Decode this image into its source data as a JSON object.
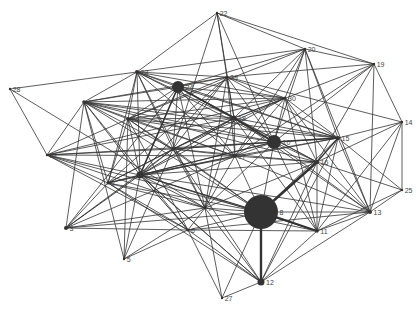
{
  "graph": {
    "type": "network",
    "width": 420,
    "height": 309,
    "colors": {
      "edge": "#333333",
      "node": "#333333",
      "label": "#444444",
      "background": "#ffffff"
    },
    "nodes": [
      {
        "id": "1",
        "x": 140,
        "y": 175,
        "r": 3.5
      },
      {
        "id": "2",
        "x": 108,
        "y": 183,
        "r": 1.5
      },
      {
        "id": "3",
        "x": 66,
        "y": 228,
        "r": 2.0
      },
      {
        "id": "4",
        "x": 84,
        "y": 102,
        "r": 1.8
      },
      {
        "id": "5",
        "x": 124,
        "y": 259,
        "r": 1.2
      },
      {
        "id": "6",
        "x": 188,
        "y": 230,
        "r": 1.5
      },
      {
        "id": "7",
        "x": 205,
        "y": 208,
        "r": 1.5
      },
      {
        "id": "8",
        "x": 261,
        "y": 212,
        "r": 17
      },
      {
        "id": "9",
        "x": 173,
        "y": 149,
        "r": 1.5
      },
      {
        "id": "10",
        "x": 274,
        "y": 142,
        "r": 7
      },
      {
        "id": "11",
        "x": 317,
        "y": 231,
        "r": 1.8
      },
      {
        "id": "12",
        "x": 261,
        "y": 282,
        "r": 3.5
      },
      {
        "id": "13",
        "x": 370,
        "y": 212,
        "r": 2.0
      },
      {
        "id": "14",
        "x": 402,
        "y": 122,
        "r": 1.2
      },
      {
        "id": "15",
        "x": 338,
        "y": 138,
        "r": 2.0
      },
      {
        "id": "16",
        "x": 317,
        "y": 162,
        "r": 2.0
      },
      {
        "id": "17",
        "x": 235,
        "y": 156,
        "r": 1.5
      },
      {
        "id": "18",
        "x": 234,
        "y": 118,
        "r": 2.5
      },
      {
        "id": "19",
        "x": 374,
        "y": 64,
        "r": 1.2
      },
      {
        "id": "20",
        "x": 305,
        "y": 49,
        "r": 1.2
      },
      {
        "id": "21",
        "x": 47,
        "y": 155,
        "r": 1.2
      },
      {
        "id": "22",
        "x": 217,
        "y": 13,
        "r": 1.2
      },
      {
        "id": "23",
        "x": 137,
        "y": 72,
        "r": 2.0
      },
      {
        "id": "24",
        "x": 178,
        "y": 87,
        "r": 6
      },
      {
        "id": "25",
        "x": 402,
        "y": 190,
        "r": 1.2
      },
      {
        "id": "26",
        "x": 128,
        "y": 119,
        "r": 1.8
      },
      {
        "id": "27",
        "x": 222,
        "y": 298,
        "r": 1.2
      },
      {
        "id": "28",
        "x": 10,
        "y": 89,
        "r": 1.2
      },
      {
        "id": "29",
        "x": 227,
        "y": 77,
        "r": 1.5
      },
      {
        "id": "30",
        "x": 285,
        "y": 98,
        "r": 1.5
      }
    ],
    "edges": [
      [
        "8",
        "12",
        3
      ],
      [
        "8",
        "16",
        3
      ],
      [
        "8",
        "11",
        2.5
      ],
      [
        "8",
        "1",
        1.5
      ],
      [
        "8",
        "9",
        1
      ],
      [
        "8",
        "2",
        1
      ],
      [
        "8",
        "13",
        1
      ],
      [
        "8",
        "3",
        1
      ],
      [
        "8",
        "6",
        1
      ],
      [
        "8",
        "7",
        1
      ],
      [
        "8",
        "10",
        1
      ],
      [
        "8",
        "15",
        1
      ],
      [
        "8",
        "4",
        1
      ],
      [
        "8",
        "26",
        1
      ],
      [
        "8",
        "21",
        1
      ],
      [
        "8",
        "27",
        1
      ],
      [
        "8",
        "17",
        1
      ],
      [
        "24",
        "18",
        2.5
      ],
      [
        "18",
        "10",
        2.5
      ],
      [
        "10",
        "15",
        2
      ],
      [
        "24",
        "1",
        2
      ],
      [
        "24",
        "23",
        1
      ],
      [
        "24",
        "29",
        1
      ],
      [
        "24",
        "20",
        1
      ],
      [
        "24",
        "30",
        1
      ],
      [
        "24",
        "3",
        1
      ],
      [
        "24",
        "9",
        1
      ],
      [
        "24",
        "4",
        1
      ],
      [
        "24",
        "26",
        1
      ],
      [
        "24",
        "16",
        1
      ],
      [
        "24",
        "15",
        1
      ],
      [
        "24",
        "17",
        1
      ],
      [
        "24",
        "7",
        1
      ],
      [
        "1",
        "2",
        1
      ],
      [
        "1",
        "3",
        1.2
      ],
      [
        "1",
        "4",
        1
      ],
      [
        "1",
        "5",
        1
      ],
      [
        "1",
        "6",
        1.2
      ],
      [
        "1",
        "7",
        1
      ],
      [
        "1",
        "9",
        1
      ],
      [
        "1",
        "10",
        1.2
      ],
      [
        "1",
        "15",
        1
      ],
      [
        "1",
        "16",
        1
      ],
      [
        "1",
        "17",
        1
      ],
      [
        "1",
        "18",
        1.2
      ],
      [
        "1",
        "21",
        1
      ],
      [
        "1",
        "23",
        1
      ],
      [
        "1",
        "26",
        1
      ],
      [
        "1",
        "29",
        1
      ],
      [
        "1",
        "30",
        1
      ],
      [
        "1",
        "13",
        1
      ],
      [
        "1",
        "11",
        1
      ],
      [
        "1",
        "12",
        1
      ],
      [
        "23",
        "22",
        1
      ],
      [
        "23",
        "28",
        1
      ],
      [
        "23",
        "29",
        1
      ],
      [
        "23",
        "26",
        1
      ],
      [
        "23",
        "4",
        1
      ],
      [
        "23",
        "2",
        1
      ],
      [
        "23",
        "9",
        1
      ],
      [
        "23",
        "18",
        1
      ],
      [
        "23",
        "30",
        1
      ],
      [
        "23",
        "10",
        1
      ],
      [
        "23",
        "20",
        1
      ],
      [
        "23",
        "17",
        1
      ],
      [
        "23",
        "7",
        1
      ],
      [
        "23",
        "15",
        1
      ],
      [
        "22",
        "29",
        1
      ],
      [
        "22",
        "19",
        1
      ],
      [
        "22",
        "20",
        1
      ],
      [
        "22",
        "18",
        1
      ],
      [
        "22",
        "10",
        1
      ],
      [
        "22",
        "9",
        1
      ],
      [
        "20",
        "19",
        1
      ],
      [
        "20",
        "30",
        1
      ],
      [
        "20",
        "18",
        1
      ],
      [
        "20",
        "15",
        1
      ],
      [
        "20",
        "13",
        1
      ],
      [
        "20",
        "10",
        1
      ],
      [
        "20",
        "17",
        1
      ],
      [
        "20",
        "26",
        1
      ],
      [
        "20",
        "16",
        1
      ],
      [
        "19",
        "14",
        1
      ],
      [
        "19",
        "13",
        1
      ],
      [
        "19",
        "29",
        1
      ],
      [
        "19",
        "10",
        1
      ],
      [
        "19",
        "18",
        1
      ],
      [
        "19",
        "16",
        1
      ],
      [
        "19",
        "17",
        1
      ],
      [
        "14",
        "15",
        1
      ],
      [
        "14",
        "29",
        1
      ],
      [
        "14",
        "16",
        1
      ],
      [
        "14",
        "13",
        1
      ],
      [
        "14",
        "25",
        1
      ],
      [
        "14",
        "11",
        1
      ],
      [
        "25",
        "13",
        1
      ],
      [
        "25",
        "16",
        1
      ],
      [
        "25",
        "15",
        1
      ],
      [
        "25",
        "11",
        1
      ],
      [
        "13",
        "12",
        1
      ],
      [
        "13",
        "11",
        1
      ],
      [
        "13",
        "16",
        1
      ],
      [
        "13",
        "15",
        1
      ],
      [
        "13",
        "10",
        1
      ],
      [
        "13",
        "17",
        1
      ],
      [
        "13",
        "6",
        1
      ],
      [
        "13",
        "18",
        1
      ],
      [
        "13",
        "30",
        1
      ],
      [
        "12",
        "11",
        1
      ],
      [
        "12",
        "16",
        1
      ],
      [
        "12",
        "6",
        1
      ],
      [
        "12",
        "27",
        1
      ],
      [
        "12",
        "1",
        1
      ],
      [
        "12",
        "2",
        1
      ],
      [
        "12",
        "9",
        1
      ],
      [
        "12",
        "15",
        1
      ],
      [
        "12",
        "7",
        1
      ],
      [
        "11",
        "15",
        1
      ],
      [
        "11",
        "16",
        1
      ],
      [
        "11",
        "10",
        1
      ],
      [
        "11",
        "18",
        1
      ],
      [
        "11",
        "6",
        1
      ],
      [
        "11",
        "7",
        1
      ],
      [
        "11",
        "30",
        1
      ],
      [
        "15",
        "16",
        1.5
      ],
      [
        "15",
        "30",
        1
      ],
      [
        "15",
        "18",
        1
      ],
      [
        "15",
        "29",
        1
      ],
      [
        "15",
        "17",
        1
      ],
      [
        "15",
        "9",
        1
      ],
      [
        "15",
        "26",
        1
      ],
      [
        "15",
        "4",
        1
      ],
      [
        "16",
        "17",
        1
      ],
      [
        "16",
        "9",
        1
      ],
      [
        "16",
        "10",
        1
      ],
      [
        "16",
        "18",
        1
      ],
      [
        "16",
        "30",
        1
      ],
      [
        "16",
        "7",
        1
      ],
      [
        "16",
        "4",
        1
      ],
      [
        "10",
        "30",
        1
      ],
      [
        "10",
        "29",
        1
      ],
      [
        "10",
        "17",
        1
      ],
      [
        "10",
        "9",
        1
      ],
      [
        "10",
        "26",
        1
      ],
      [
        "10",
        "4",
        1
      ],
      [
        "10",
        "21",
        1
      ],
      [
        "10",
        "2",
        1
      ],
      [
        "10",
        "7",
        1
      ],
      [
        "30",
        "29",
        1
      ],
      [
        "30",
        "18",
        1
      ],
      [
        "30",
        "17",
        1
      ],
      [
        "30",
        "9",
        1
      ],
      [
        "30",
        "26",
        1
      ],
      [
        "30",
        "4",
        1
      ],
      [
        "30",
        "21",
        1
      ],
      [
        "29",
        "18",
        1
      ],
      [
        "29",
        "26",
        1
      ],
      [
        "29",
        "4",
        1
      ],
      [
        "29",
        "9",
        1
      ],
      [
        "29",
        "17",
        1
      ],
      [
        "29",
        "7",
        1
      ],
      [
        "29",
        "2",
        1
      ],
      [
        "18",
        "17",
        1
      ],
      [
        "18",
        "9",
        1
      ],
      [
        "18",
        "26",
        1
      ],
      [
        "18",
        "4",
        1
      ],
      [
        "18",
        "7",
        1
      ],
      [
        "18",
        "21",
        1
      ],
      [
        "18",
        "2",
        1
      ],
      [
        "17",
        "9",
        1
      ],
      [
        "17",
        "26",
        1
      ],
      [
        "17",
        "4",
        1
      ],
      [
        "17",
        "21",
        1
      ],
      [
        "17",
        "2",
        1
      ],
      [
        "17",
        "7",
        1
      ],
      [
        "17",
        "3",
        1
      ],
      [
        "9",
        "26",
        1
      ],
      [
        "9",
        "4",
        1
      ],
      [
        "9",
        "21",
        1
      ],
      [
        "9",
        "2",
        1
      ],
      [
        "9",
        "7",
        1
      ],
      [
        "9",
        "3",
        1
      ],
      [
        "9",
        "5",
        1
      ],
      [
        "26",
        "4",
        1
      ],
      [
        "26",
        "21",
        1
      ],
      [
        "26",
        "2",
        1
      ],
      [
        "26",
        "5",
        1
      ],
      [
        "26",
        "6",
        1
      ],
      [
        "4",
        "21",
        1
      ],
      [
        "4",
        "2",
        1
      ],
      [
        "4",
        "6",
        1
      ],
      [
        "4",
        "3",
        1
      ],
      [
        "4",
        "5",
        1
      ],
      [
        "21",
        "2",
        1
      ],
      [
        "21",
        "7",
        1
      ],
      [
        "21",
        "6",
        1
      ],
      [
        "21",
        "28",
        1
      ],
      [
        "28",
        "7",
        1
      ],
      [
        "2",
        "3",
        1
      ],
      [
        "2",
        "7",
        1
      ],
      [
        "2",
        "6",
        1
      ],
      [
        "3",
        "6",
        1
      ],
      [
        "3",
        "7",
        1
      ],
      [
        "5",
        "6",
        1
      ],
      [
        "5",
        "7",
        1
      ],
      [
        "6",
        "7",
        1
      ],
      [
        "6",
        "27",
        1
      ],
      [
        "7",
        "27",
        1
      ]
    ]
  }
}
